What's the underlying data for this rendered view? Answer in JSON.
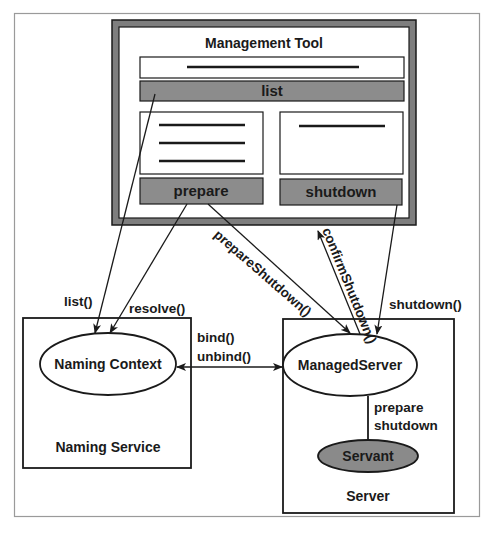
{
  "diagram": {
    "colors": {
      "background": "#ffffff",
      "outer_frame": "#9a9a9a",
      "stroke": "#1a1a1a",
      "tool_frame_fill": "#7e7e7e",
      "button_fill": "#8c8c8c",
      "servant_fill": "#8a8a8a",
      "panel_fill": "#ffffff"
    },
    "management_tool": {
      "title": "Management Tool",
      "list_button": "list",
      "prepare_button": "prepare",
      "shutdown_button": "shutdown",
      "left_panel_lines": 3,
      "right_panel_lines": 1
    },
    "naming_service": {
      "box_label": "Naming Service",
      "node_label": "Naming Context"
    },
    "server": {
      "box_label": "Server",
      "managed_server_label": "ManagedServer",
      "servant_label": "Servant",
      "internal_edge_label_line1": "prepare",
      "internal_edge_label_line2": "shutdown"
    },
    "edges": {
      "list_call": "list()",
      "resolve_call": "resolve()",
      "bind_call": "bind()",
      "unbind_call": "unbind()",
      "prepare_shutdown_call": "prepareShutdown()",
      "confirm_shutdown_call": "confirmShutdown()",
      "shutdown_call": "shutdown()"
    }
  }
}
